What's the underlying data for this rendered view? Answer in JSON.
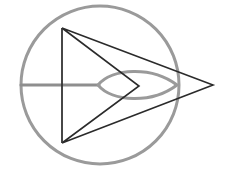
{
  "canvas": {
    "width": 233,
    "height": 169,
    "background": "#ffffff",
    "title": "Geometric line figure: circle with inscribed chevron and lens"
  },
  "palette": {
    "circle_stroke": "#9a9a9a",
    "axis_stroke": "#8e8e8e",
    "lens_stroke": "#9a9a9a",
    "chevron_stroke": "#2b2b2b",
    "spine_stroke": "#333333",
    "background": "#ffffff"
  },
  "shapes": {
    "circle": {
      "label": "outer-circle",
      "cx": 100,
      "cy": 85,
      "r": 79,
      "stroke_width": 3
    },
    "axis": {
      "label": "horizontal-axis-line",
      "x1": 21,
      "y1": 85,
      "x2": 99,
      "y2": 85,
      "stroke_width": 3
    },
    "lens": {
      "label": "lens-vesica",
      "left_x": 98,
      "left_y": 85,
      "right_x": 177,
      "right_y": 85,
      "top_y": 68,
      "bottom_y": 102,
      "stroke_width": 3,
      "path": "M 98 85 C 112 68 152 66 177 85 C 152 104 112 102 98 85 Z"
    },
    "chevron": {
      "label": "chevron-arrow-polygon",
      "points": "62,28 213,85 62,143 139,86 62,28",
      "vertices": [
        {
          "name": "top-left",
          "x": 62,
          "y": 28
        },
        {
          "name": "right-apex",
          "x": 213,
          "y": 85
        },
        {
          "name": "bottom-left",
          "x": 62,
          "y": 143
        },
        {
          "name": "inner-notch",
          "x": 139,
          "y": 86
        }
      ],
      "stroke_width": 1.6
    },
    "spine": {
      "label": "vertical-spine-line",
      "x1": 62,
      "y1": 28,
      "x2": 62,
      "y2": 143,
      "stroke_width": 1.8
    }
  }
}
